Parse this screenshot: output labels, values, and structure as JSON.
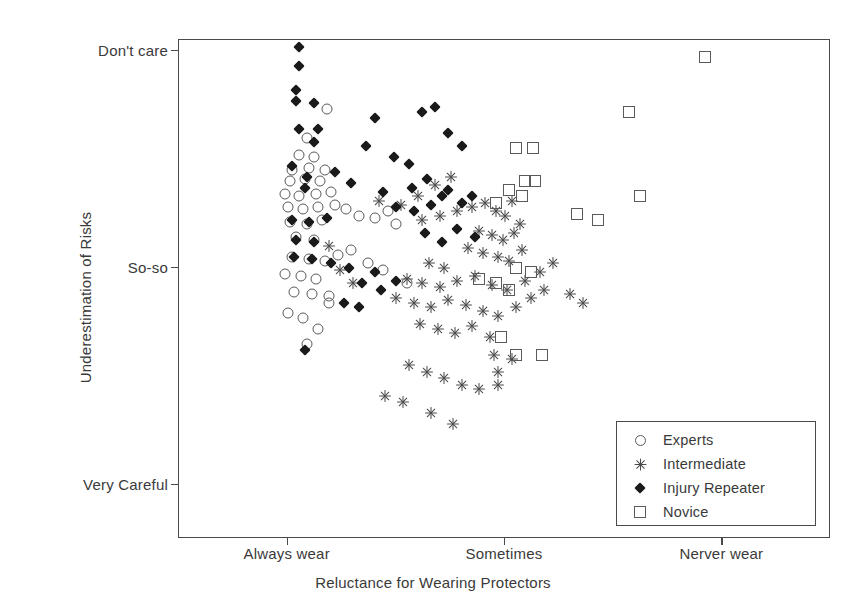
{
  "chart_data": {
    "type": "scatter",
    "title": "",
    "xlabel": "Reluctance for Wearing Protectors",
    "ylabel": "Underestimation of Risks",
    "xticklabels": [
      "Always wear",
      "Sometimes",
      "Nerver wear"
    ],
    "xtickvalues": [
      1,
      2,
      3
    ],
    "yticklabels": [
      "Don't care",
      "So-so",
      "Very Careful"
    ],
    "ytickvalues": [
      3,
      2,
      1
    ],
    "xlim": [
      0.5,
      3.5
    ],
    "ylim": [
      0.75,
      3.05
    ],
    "grid": false,
    "legend_position": "bottom-right",
    "marker_color": "#4a4a4a",
    "frame_color": "#4a4a4a",
    "series": [
      {
        "name": "Experts",
        "marker": "open-circle",
        "points": [
          [
            1.09,
            2.6
          ],
          [
            1.18,
            2.73
          ],
          [
            1.05,
            2.52
          ],
          [
            1.12,
            2.51
          ],
          [
            1.02,
            2.45
          ],
          [
            1.1,
            2.46
          ],
          [
            1.17,
            2.45
          ],
          [
            1.01,
            2.4
          ],
          [
            1.08,
            2.41
          ],
          [
            1.15,
            2.4
          ],
          [
            0.99,
            2.34
          ],
          [
            1.05,
            2.33
          ],
          [
            1.13,
            2.34
          ],
          [
            1.2,
            2.35
          ],
          [
            1.0,
            2.28
          ],
          [
            1.07,
            2.27
          ],
          [
            1.14,
            2.28
          ],
          [
            1.22,
            2.29
          ],
          [
            1.27,
            2.27
          ],
          [
            1.01,
            2.21
          ],
          [
            1.09,
            2.2
          ],
          [
            1.16,
            2.22
          ],
          [
            1.33,
            2.24
          ],
          [
            1.4,
            2.23
          ],
          [
            1.04,
            2.14
          ],
          [
            1.12,
            2.13
          ],
          [
            1.46,
            2.26
          ],
          [
            1.5,
            2.2
          ],
          [
            1.02,
            2.05
          ],
          [
            1.1,
            2.04
          ],
          [
            1.17,
            2.03
          ],
          [
            1.23,
            2.06
          ],
          [
            0.99,
            1.97
          ],
          [
            1.06,
            1.96
          ],
          [
            1.13,
            1.95
          ],
          [
            1.29,
            2.08
          ],
          [
            1.03,
            1.89
          ],
          [
            1.11,
            1.88
          ],
          [
            1.19,
            1.87
          ],
          [
            1.19,
            1.84
          ],
          [
            1.0,
            1.79
          ],
          [
            1.07,
            1.77
          ],
          [
            1.14,
            1.72
          ],
          [
            1.37,
            2.02
          ],
          [
            1.44,
            1.99
          ],
          [
            1.09,
            1.65
          ],
          [
            1.55,
            1.93
          ]
        ]
      },
      {
        "name": "Intermediate",
        "marker": "asterisk",
        "points": [
          [
            1.24,
            1.99
          ],
          [
            1.3,
            1.93
          ],
          [
            1.19,
            2.1
          ],
          [
            1.42,
            2.31
          ],
          [
            1.52,
            2.29
          ],
          [
            1.6,
            2.33
          ],
          [
            1.68,
            2.38
          ],
          [
            1.75,
            2.42
          ],
          [
            1.62,
            2.22
          ],
          [
            1.7,
            2.24
          ],
          [
            1.78,
            2.26
          ],
          [
            1.85,
            2.28
          ],
          [
            1.91,
            2.3
          ],
          [
            1.96,
            2.26
          ],
          [
            2.0,
            2.24
          ],
          [
            2.03,
            2.31
          ],
          [
            1.88,
            2.17
          ],
          [
            1.94,
            2.15
          ],
          [
            1.99,
            2.13
          ],
          [
            2.04,
            2.16
          ],
          [
            2.07,
            2.2
          ],
          [
            1.83,
            2.09
          ],
          [
            1.9,
            2.07
          ],
          [
            1.97,
            2.05
          ],
          [
            2.02,
            2.03
          ],
          [
            2.08,
            2.08
          ],
          [
            1.65,
            2.02
          ],
          [
            1.72,
            2.0
          ],
          [
            1.55,
            1.95
          ],
          [
            1.62,
            1.93
          ],
          [
            1.7,
            1.91
          ],
          [
            1.78,
            1.94
          ],
          [
            1.86,
            1.96
          ],
          [
            1.94,
            1.92
          ],
          [
            2.01,
            1.9
          ],
          [
            2.09,
            1.94
          ],
          [
            2.16,
            1.98
          ],
          [
            2.22,
            2.02
          ],
          [
            1.5,
            1.86
          ],
          [
            1.58,
            1.84
          ],
          [
            1.66,
            1.82
          ],
          [
            1.74,
            1.85
          ],
          [
            1.82,
            1.83
          ],
          [
            1.9,
            1.8
          ],
          [
            1.97,
            1.78
          ],
          [
            2.05,
            1.82
          ],
          [
            1.61,
            1.74
          ],
          [
            1.69,
            1.72
          ],
          [
            1.77,
            1.7
          ],
          [
            1.85,
            1.73
          ],
          [
            1.93,
            1.68
          ],
          [
            2.12,
            1.86
          ],
          [
            2.18,
            1.9
          ],
          [
            1.95,
            1.6
          ],
          [
            2.03,
            1.58
          ],
          [
            1.56,
            1.55
          ],
          [
            1.64,
            1.52
          ],
          [
            1.72,
            1.49
          ],
          [
            1.8,
            1.46
          ],
          [
            1.88,
            1.44
          ],
          [
            1.45,
            1.41
          ],
          [
            1.53,
            1.38
          ],
          [
            1.97,
            1.52
          ],
          [
            1.97,
            1.46
          ],
          [
            1.66,
            1.33
          ],
          [
            1.76,
            1.28
          ],
          [
            2.3,
            1.88
          ],
          [
            2.36,
            1.84
          ]
        ]
      },
      {
        "name": "Injury Repeater",
        "marker": "filled-diamond",
        "points": [
          [
            1.05,
            3.02
          ],
          [
            1.05,
            2.93
          ],
          [
            1.04,
            2.82
          ],
          [
            1.04,
            2.77
          ],
          [
            1.12,
            2.76
          ],
          [
            1.4,
            2.69
          ],
          [
            1.05,
            2.64
          ],
          [
            1.14,
            2.64
          ],
          [
            1.12,
            2.58
          ],
          [
            1.36,
            2.56
          ],
          [
            1.49,
            2.51
          ],
          [
            1.56,
            2.48
          ],
          [
            1.62,
            2.72
          ],
          [
            1.68,
            2.74
          ],
          [
            1.74,
            2.62
          ],
          [
            1.8,
            2.56
          ],
          [
            1.02,
            2.47
          ],
          [
            1.09,
            2.42
          ],
          [
            1.08,
            2.37
          ],
          [
            1.22,
            2.44
          ],
          [
            1.29,
            2.39
          ],
          [
            1.44,
            2.35
          ],
          [
            1.57,
            2.37
          ],
          [
            1.64,
            2.41
          ],
          [
            1.71,
            2.33
          ],
          [
            1.5,
            2.28
          ],
          [
            1.58,
            2.26
          ],
          [
            1.66,
            2.29
          ],
          [
            1.02,
            2.22
          ],
          [
            1.1,
            2.21
          ],
          [
            1.18,
            2.23
          ],
          [
            1.74,
            2.36
          ],
          [
            1.8,
            2.3
          ],
          [
            1.85,
            2.33
          ],
          [
            1.04,
            2.13
          ],
          [
            1.12,
            2.12
          ],
          [
            1.03,
            2.05
          ],
          [
            1.11,
            2.04
          ],
          [
            1.2,
            2.02
          ],
          [
            1.28,
            2.0
          ],
          [
            1.4,
            1.98
          ],
          [
            1.34,
            1.93
          ],
          [
            1.43,
            1.9
          ],
          [
            1.5,
            1.94
          ],
          [
            1.26,
            1.84
          ],
          [
            1.33,
            1.82
          ],
          [
            1.08,
            1.62
          ],
          [
            1.78,
            2.18
          ],
          [
            1.86,
            2.14
          ],
          [
            1.71,
            2.12
          ],
          [
            1.63,
            2.16
          ]
        ]
      },
      {
        "name": "Novice",
        "marker": "open-square",
        "points": [
          [
            2.92,
            2.97
          ],
          [
            2.57,
            2.72
          ],
          [
            2.05,
            2.55
          ],
          [
            2.13,
            2.55
          ],
          [
            2.09,
            2.4
          ],
          [
            2.14,
            2.4
          ],
          [
            2.02,
            2.36
          ],
          [
            2.08,
            2.33
          ],
          [
            1.96,
            2.3
          ],
          [
            2.62,
            2.33
          ],
          [
            2.43,
            2.22
          ],
          [
            2.33,
            2.25
          ],
          [
            2.05,
            2.0
          ],
          [
            2.12,
            1.98
          ],
          [
            1.88,
            1.95
          ],
          [
            1.96,
            1.93
          ],
          [
            2.02,
            1.9
          ],
          [
            1.98,
            1.68
          ],
          [
            2.05,
            1.6
          ],
          [
            2.17,
            1.6
          ]
        ]
      }
    ]
  },
  "axes": {
    "x": {
      "title": "Reluctance for Wearing Protectors",
      "ticks": [
        {
          "label": "Always wear",
          "value": 1
        },
        {
          "label": "Sometimes",
          "value": 2
        },
        {
          "label": "Nerver wear",
          "value": 3
        }
      ]
    },
    "y": {
      "title": "Underestimation of Risks",
      "ticks": [
        {
          "label": "Don't care",
          "value": 3
        },
        {
          "label": "So-so",
          "value": 2
        },
        {
          "label": "Very Careful",
          "value": 1
        }
      ]
    }
  },
  "legend": {
    "entries": [
      {
        "label": "Experts",
        "marker": "open-circle"
      },
      {
        "label": "Intermediate",
        "marker": "asterisk"
      },
      {
        "label": "Injury Repeater",
        "marker": "filled-diamond"
      },
      {
        "label": "Novice",
        "marker": "open-square"
      }
    ]
  }
}
